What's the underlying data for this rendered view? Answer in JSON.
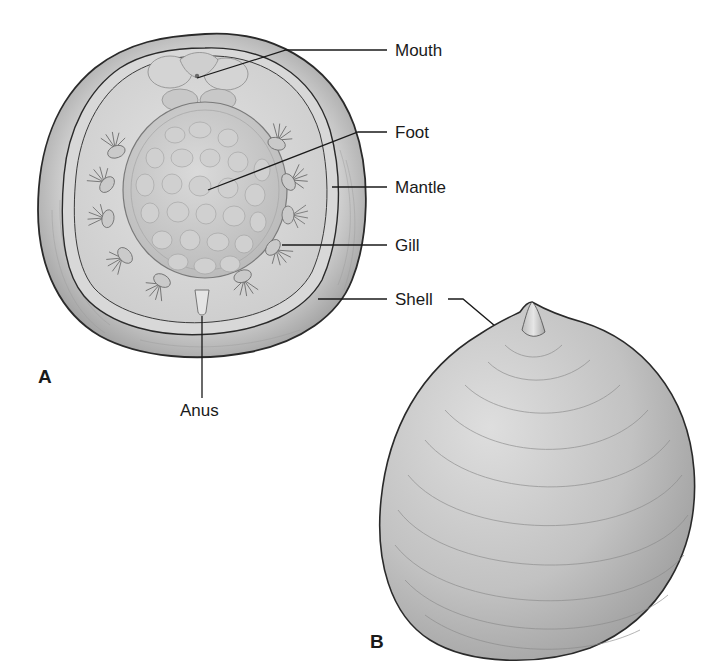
{
  "figure": {
    "panels": [
      {
        "id": "A",
        "letter": "A",
        "view": "ventral"
      },
      {
        "id": "B",
        "letter": "B",
        "view": "dorsal"
      }
    ],
    "labels": {
      "mouth": "Mouth",
      "foot": "Foot",
      "mantle": "Mantle",
      "gill": "Gill",
      "shell_a": "Shell",
      "anus": "Anus"
    },
    "colors": {
      "background": "#ffffff",
      "outline": "#2a2a2a",
      "shell_rim": "#b8b8b8",
      "mantle_fill": "#d6d6d6",
      "foot_fill": "#c9c9c9",
      "dorsal_shell": "#c4c4c4",
      "label_text": "#1a1a1a"
    }
  }
}
